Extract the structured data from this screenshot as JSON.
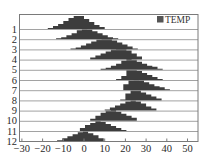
{
  "chart_data": {
    "type": "ridgeline-histogram",
    "title": "",
    "xlabel": "",
    "ylabel": "",
    "xlim": [
      -30,
      55
    ],
    "x_ticks": [
      -30,
      -20,
      -10,
      0,
      10,
      20,
      30,
      40,
      50
    ],
    "y_categories": [
      "1",
      "2",
      "3",
      "4",
      "5",
      "6",
      "7",
      "8",
      "9",
      "10",
      "11",
      "12"
    ],
    "legend": {
      "entries": [
        "TEMP"
      ],
      "position": "upper right"
    },
    "grid": false,
    "bin_width": 2.5,
    "fill_color": "#3d3d3d",
    "series": [
      {
        "name": "1",
        "bin_start": -17.5,
        "heights": [
          1,
          3,
          5,
          8,
          11,
          13,
          13,
          10,
          7,
          4,
          2
        ]
      },
      {
        "name": "2",
        "bin_start": -13.5,
        "heights": [
          1,
          2,
          4,
          6,
          9,
          11,
          10,
          8,
          6,
          4,
          2,
          1
        ]
      },
      {
        "name": "3",
        "bin_start": -6.5,
        "heights": [
          1,
          2,
          4,
          6,
          8,
          10,
          12,
          11,
          9,
          7,
          5,
          3,
          1
        ]
      },
      {
        "name": "4",
        "bin_start": 3.0,
        "heights": [
          2,
          4,
          6,
          8,
          10,
          11,
          11,
          9,
          6,
          3
        ]
      },
      {
        "name": "5",
        "bin_start": 8.0,
        "heights": [
          1,
          2,
          4,
          6,
          9,
          11,
          10,
          8,
          6,
          4,
          3,
          1
        ]
      },
      {
        "name": "6",
        "bin_start": 15.5,
        "heights": [
          1,
          4,
          10,
          10,
          9,
          7,
          5,
          3,
          1
        ]
      },
      {
        "name": "7",
        "bin_start": 19.0,
        "heights": [
          6,
          10,
          11,
          10,
          8,
          6,
          4,
          3,
          1
        ]
      },
      {
        "name": "8",
        "bin_start": 17.5,
        "heights": [
          1,
          7,
          10,
          10,
          8,
          6,
          4,
          2
        ]
      },
      {
        "name": "9",
        "bin_start": 10.0,
        "heights": [
          1,
          3,
          5,
          7,
          9,
          10,
          9,
          7,
          4,
          2
        ]
      },
      {
        "name": "10",
        "bin_start": 3.0,
        "heights": [
          2,
          5,
          8,
          10,
          11,
          9,
          7,
          5,
          3
        ]
      },
      {
        "name": "11",
        "bin_start": -2.0,
        "heights": [
          3,
          6,
          8,
          10,
          9,
          7,
          5,
          3,
          1
        ]
      },
      {
        "name": "12",
        "bin_start": -13.0,
        "heights": [
          1,
          3,
          5,
          7,
          9,
          10,
          8,
          6,
          3
        ]
      }
    ]
  },
  "legend": {
    "label": "TEMP"
  }
}
